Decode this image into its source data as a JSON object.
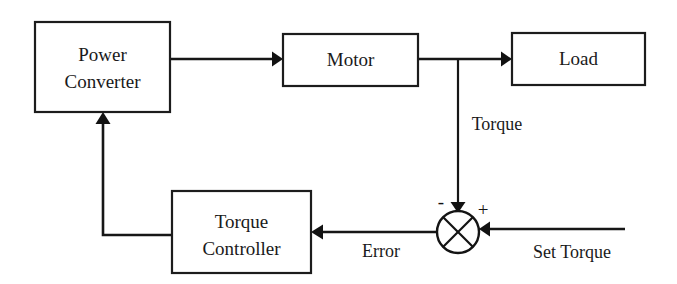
{
  "diagram": {
    "background_color": "#ffffff",
    "line_color": "#161616",
    "text_color": "#1a1a1a",
    "blocks": [
      {
        "id": "power-converter",
        "label_line1": "Power",
        "label_line2": "Converter"
      },
      {
        "id": "motor",
        "label_line1": "Motor",
        "label_line2": ""
      },
      {
        "id": "load",
        "label_line1": "Load",
        "label_line2": ""
      },
      {
        "id": "torque-controller",
        "label_line1": "Torque",
        "label_line2": "Controller"
      }
    ],
    "signals": [
      {
        "id": "torque",
        "label": "Torque"
      },
      {
        "id": "error",
        "label": "Error"
      },
      {
        "id": "set-torque",
        "label": "Set Torque"
      }
    ],
    "summing_junction": {
      "negative_sign": "-",
      "positive_sign": "+"
    }
  }
}
